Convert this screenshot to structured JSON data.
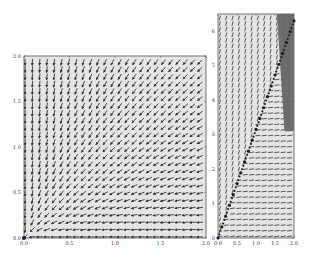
{
  "chart_data": [
    {
      "type": "quiver",
      "title": "",
      "xlabel": "",
      "ylabel": "",
      "xlim": [
        0.0,
        2.0
      ],
      "ylim": [
        0.0,
        2.0
      ],
      "x_ticks": [
        "0.0",
        "0.5",
        "1.0",
        "1.5",
        "2.0"
      ],
      "y_ticks": [
        "0.0",
        "0.5",
        "1.0",
        "1.5",
        "2.0"
      ],
      "grid": false,
      "legend": null,
      "grid_points": 25,
      "field_description": "Radial vector field pointing toward origin (0,0); arrows near x=0 point straight down, arrows near y=0 point straight left",
      "markers": [
        {
          "x": 0.0,
          "y": 0.0,
          "label": "origin point"
        }
      ],
      "background": "#e4e4e4",
      "arrow_color": "#333333"
    },
    {
      "type": "quiver",
      "title": "",
      "xlabel": "",
      "ylabel": "",
      "xlim": [
        0.0,
        2.0
      ],
      "ylim": [
        0.0,
        6.5
      ],
      "x_ticks": [
        "0.0",
        "0.5",
        "1.0",
        "1.5",
        "2.0"
      ],
      "y_ticks": [
        "0",
        "1",
        "2",
        "3",
        "4",
        "5",
        "6"
      ],
      "grid": false,
      "legend": null,
      "grid_points_x": 12,
      "grid_points_y": 40,
      "field_description": "Vector field with dense diagonal arrows; trajectory of dots from (0,0) to (2.0,6.3) along line y≈3.15x",
      "trajectory": [
        {
          "x": 0.0,
          "y": 0.0
        },
        {
          "x": 0.1,
          "y": 0.32
        },
        {
          "x": 0.2,
          "y": 0.63
        },
        {
          "x": 0.3,
          "y": 0.95
        },
        {
          "x": 0.4,
          "y": 1.26
        },
        {
          "x": 0.5,
          "y": 1.58
        },
        {
          "x": 0.6,
          "y": 1.89
        },
        {
          "x": 0.7,
          "y": 2.21
        },
        {
          "x": 0.8,
          "y": 2.52
        },
        {
          "x": 0.9,
          "y": 2.84
        },
        {
          "x": 1.0,
          "y": 3.15
        },
        {
          "x": 1.1,
          "y": 3.47
        },
        {
          "x": 1.2,
          "y": 3.78
        },
        {
          "x": 1.3,
          "y": 4.1
        },
        {
          "x": 1.4,
          "y": 4.41
        },
        {
          "x": 1.5,
          "y": 4.73
        },
        {
          "x": 1.6,
          "y": 5.04
        },
        {
          "x": 1.7,
          "y": 5.36
        },
        {
          "x": 1.8,
          "y": 5.67
        },
        {
          "x": 1.9,
          "y": 5.99
        },
        {
          "x": 2.0,
          "y": 6.3
        }
      ],
      "shaded_region": {
        "color": "#666666",
        "polygon": [
          [
            1.55,
            6.5
          ],
          [
            2.0,
            6.5
          ],
          [
            2.0,
            3.1
          ],
          [
            1.75,
            3.1
          ]
        ]
      },
      "background": "#e4e4e4",
      "arrow_color": "#333333"
    }
  ]
}
